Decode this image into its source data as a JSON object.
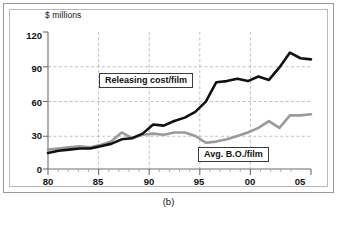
{
  "figure": {
    "caption": "(b)"
  },
  "chart_data": {
    "type": "line",
    "title": "",
    "subtitle": "",
    "xlabel": "",
    "ylabel": "$ millions",
    "ylim": [
      0,
      120
    ],
    "xlim": [
      1980,
      2005
    ],
    "yticks": [
      0,
      30,
      60,
      90,
      120
    ],
    "ytick_labels": [
      "0",
      "30",
      "60",
      "90",
      "120"
    ],
    "xticks": [
      1980,
      1985,
      1990,
      1995,
      2000,
      2005
    ],
    "xtick_labels": [
      "80",
      "85",
      "90",
      "95",
      "00",
      "05"
    ],
    "grid": true,
    "grid_style": "dashed",
    "legend_position": "inline-annotations",
    "x": [
      1980,
      1981,
      1982,
      1983,
      1984,
      1985,
      1986,
      1987,
      1988,
      1989,
      1990,
      1991,
      1992,
      1993,
      1994,
      1995,
      1996,
      1997,
      1998,
      1999,
      2000,
      2001,
      2002,
      2003,
      2004,
      2005
    ],
    "series": [
      {
        "name": "Releasing cost/film",
        "color": "#111111",
        "values": [
          14,
          16,
          17,
          18,
          18,
          20,
          22,
          26,
          27,
          31,
          39,
          38,
          42,
          45,
          50,
          59,
          76,
          77,
          79,
          77,
          81,
          78,
          89,
          102,
          97,
          96
        ]
      },
      {
        "name": "Avg. B.O./film",
        "color": "#9a9a9a",
        "values": [
          17,
          18,
          19,
          20,
          19,
          21,
          24,
          32,
          27,
          30,
          31,
          30,
          32,
          32,
          29,
          23,
          24,
          26,
          29,
          32,
          36,
          42,
          36,
          47,
          47,
          48
        ]
      }
    ],
    "annotations": [
      {
        "label": "Releasing cost/film",
        "x": 1988,
        "y": 78
      },
      {
        "label": "Avg. B.O./film",
        "x": 1999,
        "y": 13
      }
    ]
  }
}
